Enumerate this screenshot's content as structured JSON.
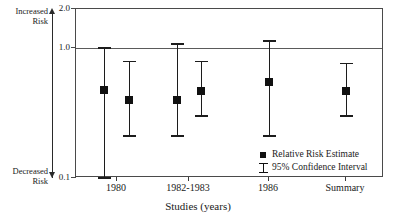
{
  "chart_data": {
    "type": "scatter",
    "title": "",
    "xlabel": "Studies (years)",
    "ylabel": "",
    "scale": "log",
    "ylim": [
      0.1,
      2.0
    ],
    "ytick_labels": [
      "2.0",
      "1.0",
      "0.1"
    ],
    "ytick_values": [
      2.0,
      1.0,
      0.1
    ],
    "grid": false,
    "reference_line": 1.0,
    "axis_direction_labels": {
      "top_line1": "Increased",
      "top_line2": "Risk",
      "bottom_line1": "Decreased",
      "bottom_line2": "Risk"
    },
    "categories": [
      "1980",
      "1982-1983",
      "1986",
      "Summary"
    ],
    "legend": {
      "position": "inside-bottom-center",
      "entries": [
        {
          "marker": "square",
          "label": "Relative Risk Estimate"
        },
        {
          "marker": "i-bar",
          "label": "95% Confidence Interval"
        }
      ]
    },
    "points": [
      {
        "group": "1980",
        "estimate": 0.48,
        "ci_low": 0.1,
        "ci_high": 1.0
      },
      {
        "group": "1980",
        "estimate": 0.4,
        "ci_low": 0.21,
        "ci_high": 0.79
      },
      {
        "group": "1982-1983",
        "estimate": 0.4,
        "ci_low": 0.21,
        "ci_high": 1.07
      },
      {
        "group": "1982-1983",
        "estimate": 0.47,
        "ci_low": 0.3,
        "ci_high": 0.79
      },
      {
        "group": "1986",
        "estimate": 0.55,
        "ci_low": 0.21,
        "ci_high": 1.13
      },
      {
        "group": "Summary",
        "estimate": 0.47,
        "ci_low": 0.3,
        "ci_high": 0.76
      }
    ]
  },
  "layout": {
    "plot": {
      "left": 75,
      "top": 8,
      "width": 308,
      "height": 169
    },
    "point_x": [
      103,
      128,
      176,
      200,
      268,
      345
    ],
    "tick_x": [
      116,
      188,
      268,
      345
    ]
  }
}
